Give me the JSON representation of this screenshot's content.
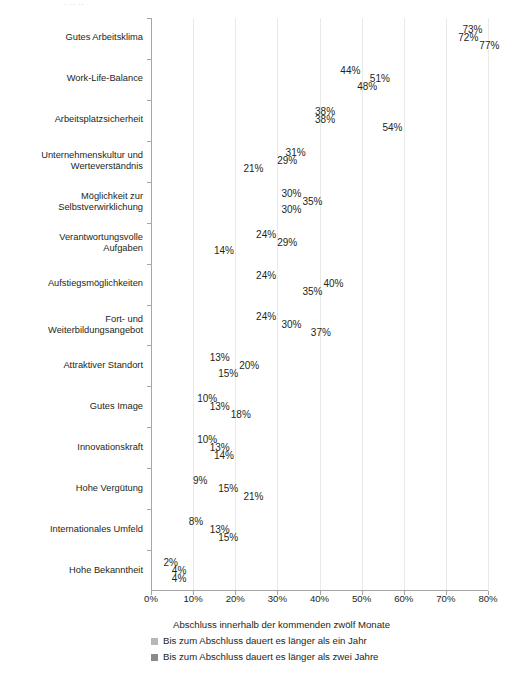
{
  "top_artifact": "· ··  ··",
  "chart_data": {
    "type": "bar",
    "orientation": "horizontal",
    "title": "",
    "xlabel": "",
    "ylabel": "",
    "xlim": [
      0,
      80
    ],
    "xticks": [
      0,
      10,
      20,
      30,
      40,
      50,
      60,
      70,
      80
    ],
    "xtick_labels": [
      "0%",
      "10%",
      "20%",
      "30%",
      "40%",
      "50%",
      "60%",
      "70%",
      "80%"
    ],
    "grid": true,
    "grid_axis": "x",
    "value_suffix": "%",
    "legend_position": "bottom",
    "legend_title": "",
    "categories": [
      "Gutes Arbeitsklima",
      "Work-Life-Balance",
      "Arbeitsplatzsicherheit",
      "Unternehmenskultur und\nWerteverständnis",
      "Möglichkeit zur\nSelbstverwirklichung",
      "Verantwortungsvolle\nAufgaben",
      "Aufstiegsmöglichkeiten",
      "Fort- und\nWeiterbildungsangebot",
      "Attraktiver Standort",
      "Gutes Image",
      "Innovationskraft",
      "Hohe Vergütung",
      "Internationales Umfeld",
      "Hohe Bekanntheit"
    ],
    "series": [
      {
        "name": "Abschluss innerhalb der kommenden zwölf Monate",
        "color": "#f2f2f2",
        "values": [
          73,
          44,
          38,
          31,
          30,
          24,
          24,
          24,
          13,
          10,
          10,
          9,
          8,
          2
        ],
        "labels": [
          "73%",
          "44%",
          "38%",
          "31%",
          "30%",
          "24%",
          "24%",
          "24%",
          "13%",
          "10%",
          "10%",
          "9%",
          "8%",
          "2%"
        ]
      },
      {
        "name": "Bis zum Abschluss dauert es länger als ein Jahr",
        "color": "#b7b7b7",
        "values": [
          72,
          51,
          38,
          29,
          35,
          29,
          40,
          30,
          20,
          13,
          13,
          15,
          13,
          4
        ],
        "labels": [
          "72%",
          "51%",
          "38%",
          "29%",
          "35%",
          "29%",
          "40%",
          "30%",
          "20%",
          "13%",
          "13%",
          "15%",
          "13%",
          "4%"
        ]
      },
      {
        "name": "Bis zum Abschluss dauert es länger als zwei Jahre",
        "color": "#8a8a8a",
        "values": [
          77,
          48,
          54,
          21,
          30,
          14,
          35,
          37,
          15,
          18,
          14,
          21,
          15,
          4
        ],
        "labels": [
          "77%",
          "48%",
          "54%",
          "21%",
          "30%",
          "14%",
          "35%",
          "37%",
          "15%",
          "18%",
          "14%",
          "21%",
          "15%",
          "4%"
        ]
      }
    ]
  },
  "legend": {
    "entries": [
      {
        "label": "Abschluss innerhalb der kommenden zwölf Monate"
      },
      {
        "label": "Bis zum Abschluss dauert es länger als ein Jahr"
      },
      {
        "label": "Bis zum Abschluss dauert es länger als zwei Jahre"
      }
    ]
  }
}
